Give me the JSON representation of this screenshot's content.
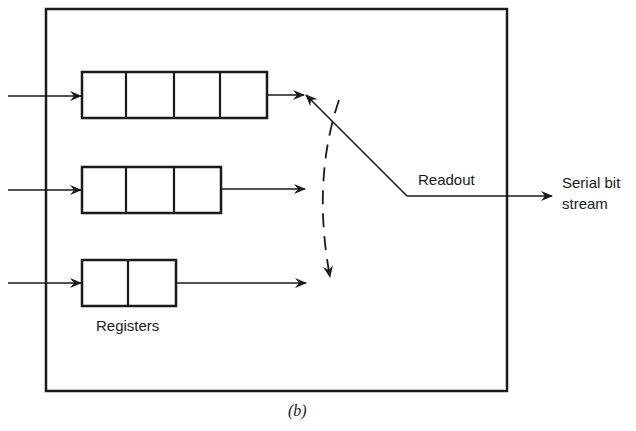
{
  "diagram": {
    "caption": "(b)",
    "labels": {
      "registers": "Registers",
      "readout": "Readout",
      "output_line1": "Serial bit",
      "output_line2": "stream"
    },
    "registers": [
      {
        "name": "register-1",
        "cells": 4
      },
      {
        "name": "register-2",
        "cells": 3
      },
      {
        "name": "register-3",
        "cells": 2
      }
    ],
    "colors": {
      "stroke": "#1a1a1a",
      "background": "#ffffff"
    }
  }
}
